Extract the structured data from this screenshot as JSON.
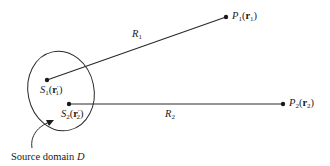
{
  "diagram": {
    "colors": {
      "stroke": "#2a2a2a",
      "text": "#1a1a1a",
      "background": "#ffffff"
    },
    "source_domain": {
      "label": "Source domain",
      "symbol": "D"
    },
    "sources": [
      {
        "id": "S1",
        "name": "S",
        "sub": "1",
        "vec": "r",
        "vec_sub": "1",
        "prime": "′"
      },
      {
        "id": "S2",
        "name": "S",
        "sub": "2",
        "vec": "r",
        "vec_sub": "2",
        "prime": "′"
      }
    ],
    "points": [
      {
        "id": "P1",
        "name": "P",
        "sub": "1",
        "vec": "r",
        "vec_sub": "1"
      },
      {
        "id": "P2",
        "name": "P",
        "sub": "2",
        "vec": "r",
        "vec_sub": "2"
      }
    ],
    "distances": [
      {
        "id": "R1",
        "name": "R",
        "sub": "1"
      },
      {
        "id": "R2",
        "name": "R",
        "sub": "2"
      }
    ]
  }
}
